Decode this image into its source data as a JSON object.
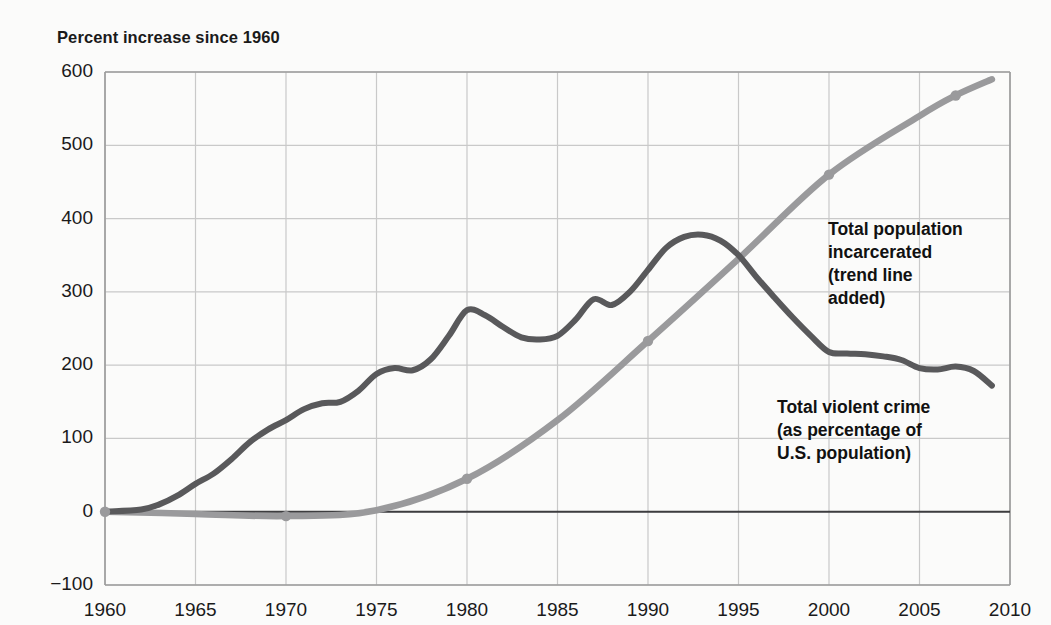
{
  "chart_data": {
    "type": "line",
    "title": "Percent increase since 1960",
    "xlabel": "",
    "ylabel": "Percent increase since 1960",
    "xlim": [
      1960,
      2010
    ],
    "ylim": [
      -100,
      600
    ],
    "grid": true,
    "legend_position": "inline-annotations",
    "xticks": [
      "1960",
      "1965",
      "1970",
      "1975",
      "1980",
      "1985",
      "1990",
      "1995",
      "2000",
      "2005",
      "2010"
    ],
    "yticks": [
      "600",
      "500",
      "400",
      "300",
      "200",
      "100",
      "0",
      "−100"
    ],
    "annotations": [
      {
        "name": "incarcerated-label",
        "text": "Total population\nincarcerated\n(trend line\nadded)"
      },
      {
        "name": "violent-crime-label",
        "text": "Total violent crime\n(as percentage of\nU.S. population)"
      }
    ],
    "series": [
      {
        "name": "Total violent crime (as percentage of U.S. population)",
        "color": "#59595b",
        "x": [
          1960,
          1962,
          1963,
          1964,
          1965,
          1966,
          1967,
          1968,
          1969,
          1970,
          1971,
          1972,
          1973,
          1974,
          1975,
          1976,
          1977,
          1978,
          1979,
          1980,
          1981,
          1982,
          1983,
          1984,
          1985,
          1986,
          1987,
          1988,
          1989,
          1990,
          1991,
          1992,
          1993,
          1994,
          1995,
          1996,
          1997,
          1998,
          1999,
          2000,
          2001,
          2002,
          2003,
          2004,
          2005,
          2006,
          2007,
          2008,
          2009
        ],
        "y": [
          0,
          3,
          10,
          22,
          38,
          52,
          72,
          95,
          112,
          125,
          140,
          148,
          150,
          165,
          188,
          196,
          193,
          208,
          240,
          275,
          268,
          252,
          238,
          235,
          240,
          262,
          290,
          282,
          300,
          330,
          360,
          375,
          378,
          370,
          350,
          320,
          292,
          265,
          240,
          218,
          216,
          215,
          212,
          207,
          196,
          194,
          198,
          192,
          172
        ]
      },
      {
        "name": "Total population incarcerated (trend line added)",
        "color": "#9a9a9c",
        "x": [
          1960,
          1965,
          1970,
          1975,
          1980,
          1985,
          1990,
          1995,
          2000,
          2005,
          2007,
          2009
        ],
        "y": [
          0,
          -3,
          -6,
          2,
          45,
          125,
          233,
          345,
          460,
          540,
          568,
          590
        ],
        "markers": [
          {
            "x": 1960,
            "y": 0
          },
          {
            "x": 1970,
            "y": -6
          },
          {
            "x": 1980,
            "y": 45
          },
          {
            "x": 1990,
            "y": 233
          },
          {
            "x": 2000,
            "y": 460
          },
          {
            "x": 2007,
            "y": 568
          }
        ]
      }
    ],
    "colors": {
      "background": "#fbfbfa",
      "grid": "#c9c9c9",
      "axis": "#9b9b9b",
      "zero_line": "#3d3d3f",
      "text": "#1a1a1a",
      "violent_crime": "#59595b",
      "incarcerated": "#9a9a9c"
    }
  }
}
